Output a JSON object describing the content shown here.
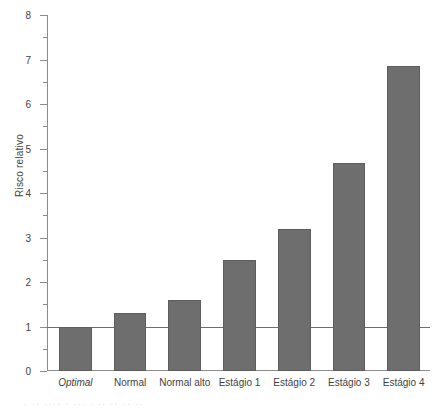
{
  "chart_data": {
    "type": "bar",
    "title": "",
    "xlabel": "",
    "ylabel": "Risco relativo",
    "categories": [
      "Optimal",
      "Normal",
      "Normal alto",
      "Estágio 1",
      "Estágio 2",
      "Estágio 3",
      "Estágio 4"
    ],
    "values": [
      1.0,
      1.3,
      1.6,
      2.5,
      3.2,
      4.68,
      6.85
    ],
    "ylim": [
      0,
      8
    ],
    "yticks": [
      0,
      1,
      2,
      3,
      4,
      5,
      6,
      7,
      8
    ],
    "ytick_labels": [
      "0",
      "1",
      "2",
      "3",
      "4",
      "5",
      "6",
      "7",
      "8"
    ],
    "yminor_ticks": [
      0.5,
      1.5,
      2.5,
      3.5,
      4.5,
      5.5,
      6.5,
      7.5
    ],
    "grid": false,
    "legend": null,
    "reference_line": {
      "value": 1,
      "orientation": "horizontal"
    },
    "bar_color": "#6e6e6e",
    "bar_edge_color": "#5d5d5d",
    "axis_color": "#8c8c8c",
    "italic_categories": [
      "Optimal"
    ]
  },
  "caption": {
    "text": "· ·· ···· · ··· · ·· ·· ·· ··"
  }
}
